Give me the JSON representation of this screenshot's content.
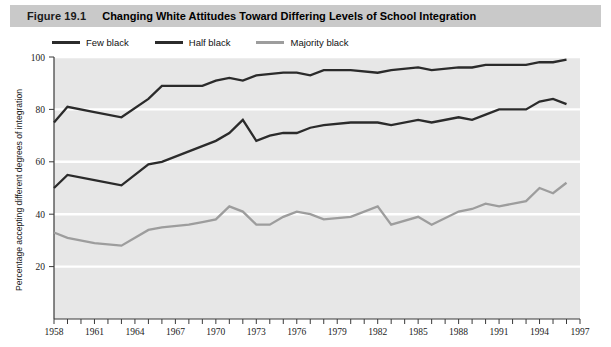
{
  "figure": {
    "number": "Figure 19.1",
    "title": "Changing White Attitudes Toward Differing Levels of School Integration"
  },
  "colors": {
    "title_bar": "#c9c9c9",
    "plot_background": "#e7e7e7",
    "gridline": "#ffffff",
    "few_black": "#2b2b2b",
    "half_black": "#2b2b2b",
    "majority_black": "#9d9d9d",
    "axis": "#3a3a3a"
  },
  "legend": {
    "position": "top-left",
    "items": [
      {
        "label": "Few black",
        "color": "#2b2b2b"
      },
      {
        "label": "Half black",
        "color": "#2b2b2b"
      },
      {
        "label": "Majority black",
        "color": "#9d9d9d"
      }
    ]
  },
  "chart_data": {
    "type": "line",
    "title": "Changing White Attitudes Toward Differing Levels of School Integration",
    "xlabel": "",
    "ylabel": "Percentage accepting different degrees of integration",
    "xlim": [
      1958,
      1997
    ],
    "ylim": [
      0,
      100
    ],
    "yticks": [
      20,
      40,
      60,
      80,
      100
    ],
    "ytick_labels": [
      "20",
      "40",
      "60",
      "80",
      "100"
    ],
    "xticks": [
      1958,
      1959,
      1960,
      1961,
      1962,
      1963,
      1964,
      1965,
      1966,
      1967,
      1968,
      1969,
      1970,
      1971,
      1972,
      1973,
      1974,
      1975,
      1976,
      1977,
      1978,
      1979,
      1980,
      1981,
      1982,
      1983,
      1984,
      1985,
      1986,
      1987,
      1988,
      1989,
      1990,
      1991,
      1992,
      1993,
      1994,
      1995,
      1996,
      1997
    ],
    "xtick_labels_shown": [
      "1958",
      "1961",
      "1964",
      "1967",
      "1970",
      "1973",
      "1976",
      "1979",
      "1982",
      "1985",
      "1988",
      "1991",
      "1994",
      "1997"
    ],
    "grid": "horizontal-white",
    "legend_position": "above-plot-left",
    "series": [
      {
        "name": "Few black",
        "color": "#2b2b2b",
        "x": [
          1958,
          1959,
          1961,
          1963,
          1965,
          1966,
          1968,
          1969,
          1970,
          1971,
          1972,
          1973,
          1975,
          1976,
          1977,
          1978,
          1980,
          1982,
          1983,
          1985,
          1986,
          1988,
          1989,
          1990,
          1991,
          1993,
          1994,
          1995,
          1996
        ],
        "values": [
          75,
          81,
          79,
          77,
          84,
          89,
          89,
          89,
          91,
          92,
          91,
          93,
          94,
          94,
          93,
          95,
          95,
          94,
          95,
          96,
          95,
          96,
          96,
          97,
          97,
          97,
          98,
          98,
          99
        ]
      },
      {
        "name": "Half black",
        "color": "#2b2b2b",
        "x": [
          1958,
          1959,
          1961,
          1963,
          1965,
          1966,
          1968,
          1969,
          1970,
          1971,
          1972,
          1973,
          1974,
          1975,
          1976,
          1977,
          1978,
          1980,
          1982,
          1983,
          1985,
          1986,
          1988,
          1989,
          1990,
          1991,
          1993,
          1994,
          1995,
          1996
        ],
        "values": [
          50,
          55,
          53,
          51,
          59,
          60,
          64,
          66,
          68,
          71,
          76,
          68,
          70,
          71,
          71,
          73,
          74,
          75,
          75,
          74,
          76,
          75,
          77,
          76,
          78,
          80,
          80,
          83,
          84,
          82
        ]
      },
      {
        "name": "Majority black",
        "color": "#9d9d9d",
        "x": [
          1958,
          1959,
          1961,
          1963,
          1965,
          1966,
          1968,
          1969,
          1970,
          1971,
          1972,
          1973,
          1974,
          1975,
          1976,
          1977,
          1978,
          1980,
          1982,
          1983,
          1985,
          1986,
          1988,
          1989,
          1990,
          1991,
          1993,
          1994,
          1995,
          1996
        ],
        "values": [
          33,
          31,
          29,
          28,
          34,
          35,
          36,
          37,
          38,
          43,
          41,
          36,
          36,
          39,
          41,
          40,
          38,
          39,
          43,
          36,
          39,
          36,
          41,
          42,
          44,
          43,
          45,
          50,
          48,
          52
        ]
      }
    ]
  }
}
